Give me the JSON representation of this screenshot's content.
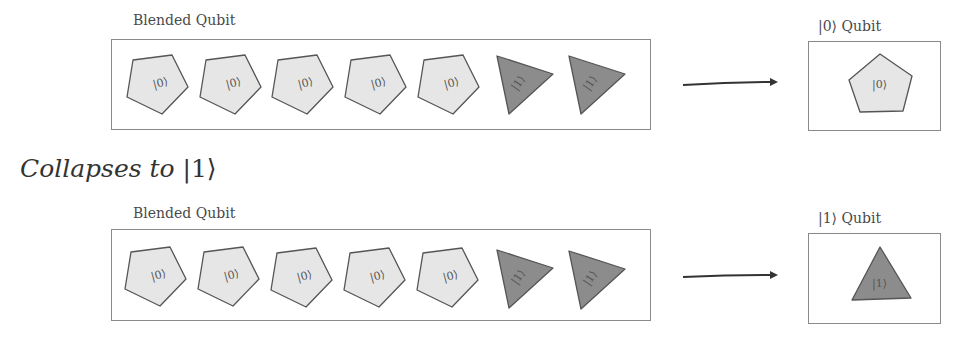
{
  "heading": {
    "text": "Collapses to ",
    "ket": "|1⟩"
  },
  "rows": [
    {
      "blended": {
        "label": "Blended Qubit",
        "shapes": [
          {
            "type": "pentagon",
            "label": "|0⟩"
          },
          {
            "type": "pentagon",
            "label": "|0⟩"
          },
          {
            "type": "pentagon",
            "label": "|0⟩"
          },
          {
            "type": "pentagon",
            "label": "|0⟩"
          },
          {
            "type": "pentagon",
            "label": "|0⟩"
          },
          {
            "type": "triangle",
            "label": "|1⟩"
          },
          {
            "type": "triangle",
            "label": "|1⟩"
          }
        ]
      },
      "arrow": "right-arrow",
      "result": {
        "label": "|0⟩ Qubit",
        "shape": {
          "type": "pentagon",
          "label": "|0⟩"
        }
      }
    },
    {
      "blended": {
        "label": "Blended Qubit",
        "shapes": [
          {
            "type": "pentagon",
            "label": "|0⟩"
          },
          {
            "type": "pentagon",
            "label": "|0⟩"
          },
          {
            "type": "pentagon",
            "label": "|0⟩"
          },
          {
            "type": "pentagon",
            "label": "|0⟩"
          },
          {
            "type": "pentagon",
            "label": "|0⟩"
          },
          {
            "type": "triangle",
            "label": "|1⟩"
          },
          {
            "type": "triangle",
            "label": "|1⟩"
          }
        ]
      },
      "arrow": "right-arrow",
      "result": {
        "label": "|1⟩ Qubit",
        "shape": {
          "type": "triangle",
          "label": "|1⟩"
        }
      }
    }
  ],
  "colors": {
    "pentagon_fill": "#e6e6e6",
    "triangle_fill": "#8c8c8c",
    "stroke": "#555555",
    "box_border": "#8a8a8a",
    "arrow": "#333333"
  }
}
